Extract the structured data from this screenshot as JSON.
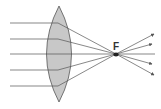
{
  "diagram": {
    "focal_label": "F",
    "colors": {
      "lens_fill": "#c8c8c8",
      "lens_stroke": "#555555",
      "ray": "#555555",
      "focal_point": "#222222"
    },
    "lens": {
      "type": "convex",
      "center_x": 59,
      "top_y": 6,
      "bottom_y": 102
    },
    "rays_in_y": [
      23,
      39,
      54,
      70,
      86
    ],
    "focal_point": {
      "x": 116,
      "y": 54
    }
  }
}
